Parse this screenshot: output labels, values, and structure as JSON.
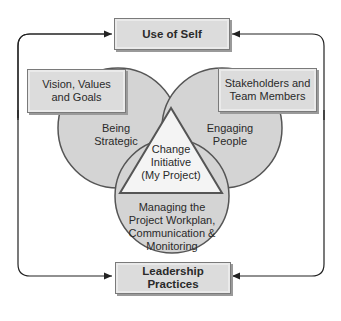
{
  "diagram": {
    "top_box": {
      "label": "Use of Self"
    },
    "bottom_box": {
      "label": "Leadership Practices"
    },
    "left_box": {
      "label_line1": "Vision, Values",
      "label_line2": "and Goals"
    },
    "right_box": {
      "label_line1": "Stakeholders and",
      "label_line2": "Team Members"
    },
    "left_circle": {
      "label_line1": "Being",
      "label_line2": "Strategic"
    },
    "right_circle": {
      "label_line1": "Engaging",
      "label_line2": "People"
    },
    "center_triangle": {
      "label_line1": "Change",
      "label_line2": "Initiative",
      "label_line3": "(My Project)"
    },
    "bottom_circle": {
      "label_line1": "Managing the",
      "label_line2": "Project Workplan,",
      "label_line3": "Communication &",
      "label_line4": "Monitoring"
    },
    "colors": {
      "fill": "#d4d4d4",
      "stroke": "#555555",
      "triangle_fill": "#f4f4f4",
      "line": "#222222"
    }
  }
}
